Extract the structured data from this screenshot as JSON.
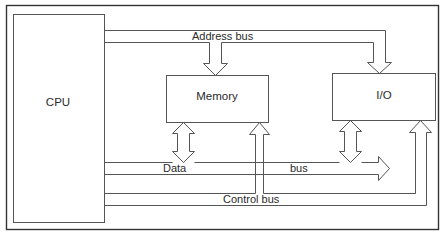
{
  "diagram": {
    "title": "",
    "nodes": {
      "cpu": {
        "label": "CPU"
      },
      "memory": {
        "label": "Memory"
      },
      "io": {
        "label": "I/O"
      }
    },
    "buses": {
      "address": {
        "label": "Address bus",
        "direction": "CPU -> Memory, I/O"
      },
      "data": {
        "label_left": "Data",
        "label_right": "bus",
        "direction": "CPU <-> Memory, I/O"
      },
      "control": {
        "label": "Control bus",
        "direction": "CPU -> Memory, I/O"
      }
    },
    "colors": {
      "stroke": "#555555",
      "text": "#2a2a2a",
      "background": "#ffffff"
    }
  }
}
